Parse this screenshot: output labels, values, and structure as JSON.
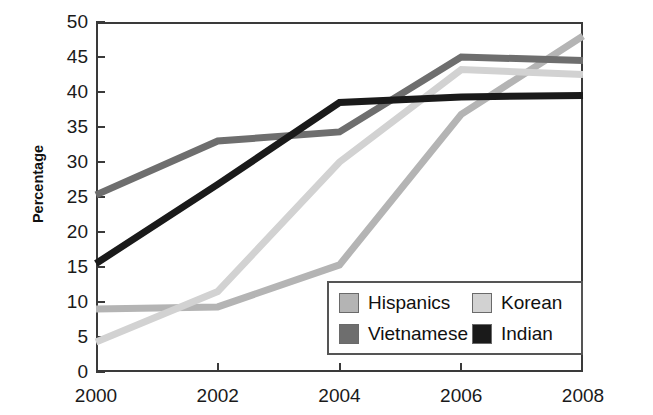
{
  "chart_data": {
    "type": "line",
    "title": "",
    "xlabel": "",
    "ylabel": "Percentage",
    "x": [
      2000,
      2002,
      2004,
      2006,
      2008
    ],
    "xtick_labels": [
      "2000",
      "2002",
      "2004",
      "2006",
      "2008"
    ],
    "ytick_labels": [
      "0",
      "5",
      "10",
      "15",
      "20",
      "25",
      "30",
      "35",
      "40",
      "45",
      "50"
    ],
    "ylim": [
      0,
      50
    ],
    "ytick_step": 5,
    "xlim": [
      2000,
      2008
    ],
    "grid": false,
    "legend_position": "inside lower-right",
    "series": [
      {
        "name": "Hispanics",
        "color": "#b4b4b4",
        "values": [
          9.0,
          9.3,
          15.3,
          36.8,
          48.0
        ]
      },
      {
        "name": "Vietnamese",
        "color": "#6e6e6e",
        "values": [
          25.3,
          33.0,
          34.3,
          45.0,
          44.5
        ]
      },
      {
        "name": "Korean",
        "color": "#d2d2d2",
        "values": [
          4.3,
          11.5,
          30.0,
          43.2,
          42.5
        ]
      },
      {
        "name": "Indian",
        "color": "#1a1a1a",
        "values": [
          15.5,
          26.8,
          38.5,
          39.3,
          39.5
        ]
      }
    ]
  },
  "legend": {
    "items": [
      {
        "label": "Hispanics",
        "color": "#b4b4b4"
      },
      {
        "label": "Korean",
        "color": "#d2d2d2"
      },
      {
        "label": "Vietnamese",
        "color": "#6e6e6e"
      },
      {
        "label": "Indian",
        "color": "#1a1a1a"
      }
    ]
  },
  "axes": {
    "y_title": "Percentage",
    "y_ticks": [
      "50",
      "45",
      "40",
      "35",
      "30",
      "25",
      "20",
      "15",
      "10",
      "5",
      "0"
    ],
    "x_ticks": [
      "2000",
      "2002",
      "2004",
      "2006",
      "2008"
    ]
  },
  "colors": {
    "axis": "#3a3a3a",
    "text": "#1a1a1a",
    "background": "#ffffff",
    "legend_border": "#555555"
  }
}
